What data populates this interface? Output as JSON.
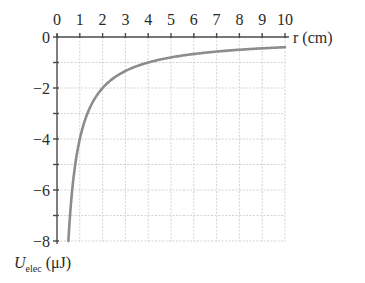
{
  "chart_data": {
    "type": "line",
    "title": "",
    "xlabel": "r (cm)",
    "ylabel": "U_elec (μJ)",
    "ylabel_main": "U",
    "ylabel_sub": "elec",
    "ylabel_unit": "(μJ)",
    "xlim": [
      0,
      10
    ],
    "ylim": [
      -8,
      0
    ],
    "x_ticks": [
      "0",
      "1",
      "2",
      "3",
      "4",
      "5",
      "6",
      "7",
      "8",
      "9",
      "10"
    ],
    "y_ticks": [
      "0",
      "−2",
      "−4",
      "−6",
      "−8"
    ],
    "grid": true,
    "series": [
      {
        "name": "U_elec",
        "x": [
          0.5,
          0.6,
          0.75,
          1,
          1.5,
          2,
          3,
          4,
          5,
          6,
          7,
          8,
          9,
          10
        ],
        "y": [
          -8.0,
          -6.67,
          -5.33,
          -4.0,
          -2.67,
          -2.0,
          -1.33,
          -1.0,
          -0.8,
          -0.67,
          -0.57,
          -0.5,
          -0.44,
          -0.4
        ],
        "color": "#8c8c8c"
      }
    ]
  }
}
